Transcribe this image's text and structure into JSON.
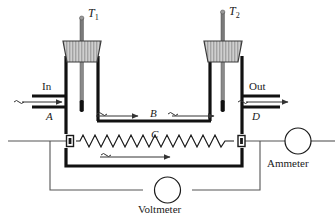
{
  "figure": {
    "kind": "continuous-flow-calorimeter-diagram",
    "background_color": "#ffffff",
    "stroke_color": "#1a1a1a",
    "thin_wire_color": "#555555",
    "stopper_fill": "#c9c9c9",
    "stopper_hatch": "#8a8a8a"
  },
  "labels": {
    "thermometer_left": "T",
    "thermometer_left_sub": "1",
    "thermometer_right": "T",
    "thermometer_right_sub": "2",
    "inlet": "In",
    "outlet": "Out",
    "point_a": "A",
    "point_b": "B",
    "point_c": "C",
    "point_d": "D",
    "ammeter": "Ammeter",
    "voltmeter": "Voltmeter"
  },
  "flow_markers": {
    "inlet_squiggle": "~",
    "outlet_squiggle": "~",
    "top_squiggle": "~",
    "mid_squiggle_left": "~",
    "mid_squiggle_right": "~",
    "bottom_squiggle": "~",
    "arrow_count": 5
  },
  "components": {
    "ammeter_symbol": "circle",
    "voltmeter_symbol": "circle",
    "resistor_symbol": "zigzag",
    "terminal_symbol": "square-binding-post",
    "terminal_count": 2
  }
}
